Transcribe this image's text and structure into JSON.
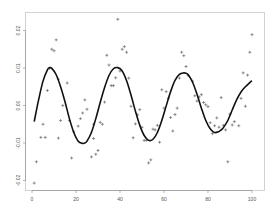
{
  "chart_data": {
    "type": "scatter",
    "title": "",
    "xlabel": "",
    "ylabel": "",
    "xlim": [
      -2,
      103
    ],
    "ylim": [
      -0.0235,
      0.0245
    ],
    "xticks": [
      0,
      20,
      40,
      60,
      80,
      100
    ],
    "xtick_labels": [
      "0",
      "20",
      "40",
      "60",
      "80",
      "100"
    ],
    "yticks": [
      -0.02,
      -0.01,
      0.0,
      0.01,
      0.02
    ],
    "ytick_labels": [
      "-0.02",
      "-0.01",
      "0.00",
      "0.01",
      "0.02"
    ],
    "grid": false,
    "legend": null,
    "series": [
      {
        "name": "observations",
        "kind": "scatter",
        "marker": "+",
        "color": "#555555",
        "x": [
          1,
          2,
          4,
          5,
          6,
          7,
          8,
          9,
          10,
          11,
          12,
          12,
          13,
          14,
          16,
          17,
          18,
          19,
          21,
          22,
          23,
          24,
          25,
          27,
          28,
          28,
          29,
          30,
          31,
          32,
          33,
          34,
          35,
          36,
          37,
          38,
          39,
          40,
          41,
          42,
          43,
          44,
          45,
          46,
          47,
          48,
          49,
          50,
          51,
          52,
          53,
          54,
          55,
          56,
          57,
          58,
          59,
          60,
          61,
          62,
          63,
          64,
          65,
          66,
          67,
          68,
          69,
          70,
          71,
          73,
          74,
          75,
          76,
          77,
          78,
          79,
          80,
          81,
          82,
          83,
          84,
          85,
          86,
          87,
          88,
          89,
          90,
          91,
          92,
          94,
          95,
          96,
          97,
          98,
          99,
          100
        ],
        "y": [
          -0.0207,
          -0.015,
          -0.0085,
          -0.005,
          -0.0085,
          0.004,
          0.0099,
          0.015,
          0.0146,
          0.0175,
          0.007,
          -0.0087,
          -0.004,
          0.0,
          0.006,
          -0.004,
          -0.014,
          -0.007,
          -0.0055,
          -0.0035,
          -0.002,
          0.0015,
          -0.001,
          -0.0137,
          -0.005,
          -0.0088,
          -0.013,
          -0.012,
          -0.0045,
          -0.005,
          0.0009,
          0.0134,
          0.0108,
          0.0053,
          0.0053,
          0.0074,
          0.023,
          0.0092,
          0.015,
          0.0157,
          0.0142,
          0.0073,
          -0.0002,
          -0.0086,
          -0.0049,
          -0.0025,
          -0.0011,
          -0.0058,
          -0.0093,
          -0.0093,
          -0.0153,
          -0.0145,
          -0.0063,
          -0.0065,
          -0.0053,
          -0.0098,
          0.0042,
          -0.0007,
          0.0037,
          0.0019,
          -0.0032,
          -0.0068,
          -0.0024,
          -0.0007,
          0.0073,
          0.0142,
          0.0133,
          0.0104,
          0.008,
          0.0065,
          0.0026,
          0.0012,
          0.0023,
          0.0029,
          0.0008,
          0.0002,
          -0.0003,
          -0.0046,
          -0.0075,
          -0.0054,
          -0.0033,
          -0.0058,
          0.0021,
          -0.0053,
          -0.0065,
          -0.015,
          -0.0023,
          -0.0052,
          -0.0043,
          -0.0054,
          0.0019,
          0.0087,
          -0.0002,
          0.0081,
          0.0142,
          0.0189
        ]
      },
      {
        "name": "fitted sinusoid",
        "kind": "line",
        "color": "#111111",
        "x": [
          1,
          3,
          5,
          7,
          8,
          9,
          11,
          13,
          15,
          17,
          19,
          21,
          23,
          24,
          25,
          27,
          29,
          31,
          33,
          35,
          37,
          39,
          41,
          43,
          45,
          47,
          49,
          51,
          53,
          55,
          57,
          59,
          61,
          63,
          65,
          67,
          69,
          70,
          71,
          73,
          75,
          77,
          79,
          81,
          83,
          85,
          86,
          87,
          89,
          91,
          93,
          95,
          97,
          99,
          100
        ],
        "y": [
          -0.0043,
          0.0015,
          0.0065,
          0.0095,
          0.0101,
          0.0099,
          0.0082,
          0.005,
          0.001,
          -0.0035,
          -0.0072,
          -0.0095,
          -0.0101,
          -0.01,
          -0.0095,
          -0.0072,
          -0.0035,
          0.0008,
          0.0048,
          0.008,
          0.0098,
          0.0101,
          0.0092,
          0.0066,
          0.0028,
          -0.0015,
          -0.0053,
          -0.008,
          -0.0093,
          -0.009,
          -0.0072,
          -0.004,
          -0.0001,
          0.0037,
          0.0067,
          0.0083,
          0.0087,
          0.0086,
          0.0082,
          0.0062,
          0.003,
          -0.0007,
          -0.004,
          -0.0062,
          -0.0072,
          -0.0069,
          -0.0065,
          -0.0059,
          -0.004,
          -0.0012,
          0.0015,
          0.0036,
          0.005,
          0.0061,
          0.0066
        ]
      }
    ]
  }
}
